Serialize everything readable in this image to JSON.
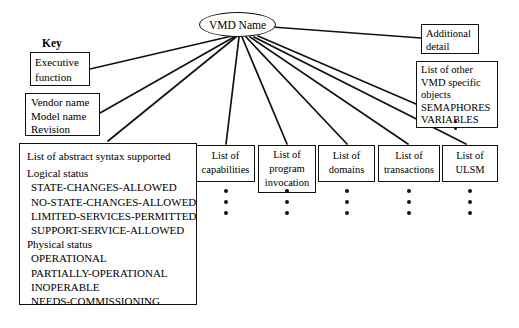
{
  "diagram": {
    "root": {
      "label": "VMD Name"
    },
    "key_label": "Key",
    "nodes": {
      "executive_function": {
        "lines": [
          "Executive",
          "function"
        ]
      },
      "vendor": {
        "lines": [
          "Vendor name",
          "Model name",
          "Revision"
        ]
      },
      "abstract_syntax": {
        "lines": [
          "List of abstract syntax supported",
          "Logical status",
          "STATE-CHANGES-ALLOWED",
          "NO-STATE-CHANGES-ALLOWED",
          "LIMITED-SERVICES-PERMITTED",
          "SUPPORT-SERVICE-ALLOWED",
          "Physical status",
          "OPERATIONAL",
          "PARTIALLY-OPERATIONAL",
          "INOPERABLE",
          "NEEDS-COMMISSIONING"
        ]
      },
      "capabilities": {
        "lines": [
          "List of",
          "capabilities"
        ]
      },
      "program_invocation": {
        "lines": [
          "List of",
          "program",
          "invocation"
        ]
      },
      "domains": {
        "lines": [
          "List of",
          "domains"
        ]
      },
      "transactions": {
        "lines": [
          "List of",
          "transactions"
        ]
      },
      "ulsm": {
        "lines": [
          "List of",
          "ULSM"
        ]
      },
      "additional_detail": {
        "lines": [
          "Additional",
          "detail"
        ]
      },
      "other_objects": {
        "lines": [
          "List of other",
          "VMD specific",
          "objects",
          "SEMAPHORES",
          "VARIABLES"
        ]
      }
    },
    "colors": {
      "stroke": "#111111",
      "background": "#ffffff",
      "text": "#000000"
    }
  }
}
